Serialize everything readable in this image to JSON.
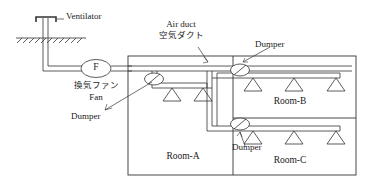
{
  "diagram": {
    "stroke_color": "#333333",
    "duct_fill": "#ffffff",
    "background": "#ffffff"
  },
  "labels": {
    "ventilator": "Ventilator",
    "air_duct_en": "Air duct",
    "air_duct_jp": "空気ダクト",
    "fan_symbol": "F",
    "fan_jp": "換気ファン",
    "fan_en": "Fan",
    "dumper_a": "Dumper",
    "dumper_b": "Dumper",
    "dumper_c": "Dumper",
    "room_a": "Room-A",
    "room_b": "Room-B",
    "room_c": "Room-C"
  },
  "components": {
    "ventilator": {
      "name": "roof ventilator cap",
      "count": 1
    },
    "fan": {
      "name": "exhaust fan",
      "symbol": "F",
      "count": 1
    },
    "dampers": {
      "name": "damper valve",
      "count": 3,
      "rooms": [
        "Room-A",
        "Room-B",
        "Room-C"
      ]
    },
    "diffusers": {
      "name": "ceiling air diffuser",
      "shape": "triangle",
      "per_room": {
        "Room-A": 2,
        "Room-B": 3,
        "Room-C": 3
      },
      "total": 8
    },
    "ground_line": {
      "name": "ground hatching",
      "hatch_count": 12
    }
  },
  "rooms": [
    {
      "id": "room-a",
      "label": "Room-A",
      "dampers": 1,
      "diffusers": 2
    },
    {
      "id": "room-b",
      "label": "Room-B",
      "dampers": 1,
      "diffusers": 3
    },
    {
      "id": "room-c",
      "label": "Room-C",
      "dampers": 1,
      "diffusers": 3
    }
  ]
}
